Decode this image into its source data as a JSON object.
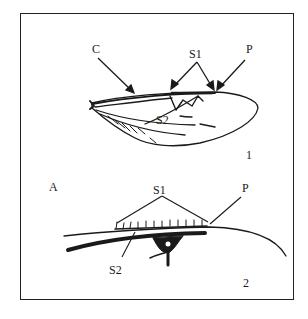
{
  "figure": {
    "panel_1": {
      "number": "1",
      "labels": {
        "c": "C",
        "s1": "S1",
        "p": "P",
        "s2": "S2"
      }
    },
    "panel_2": {
      "number": "2",
      "corner_label": "A",
      "labels": {
        "s1": "S1",
        "p": "P",
        "s2": "S2"
      }
    },
    "colors": {
      "ink": "#1a1a1a",
      "background": "#ffffff"
    }
  }
}
